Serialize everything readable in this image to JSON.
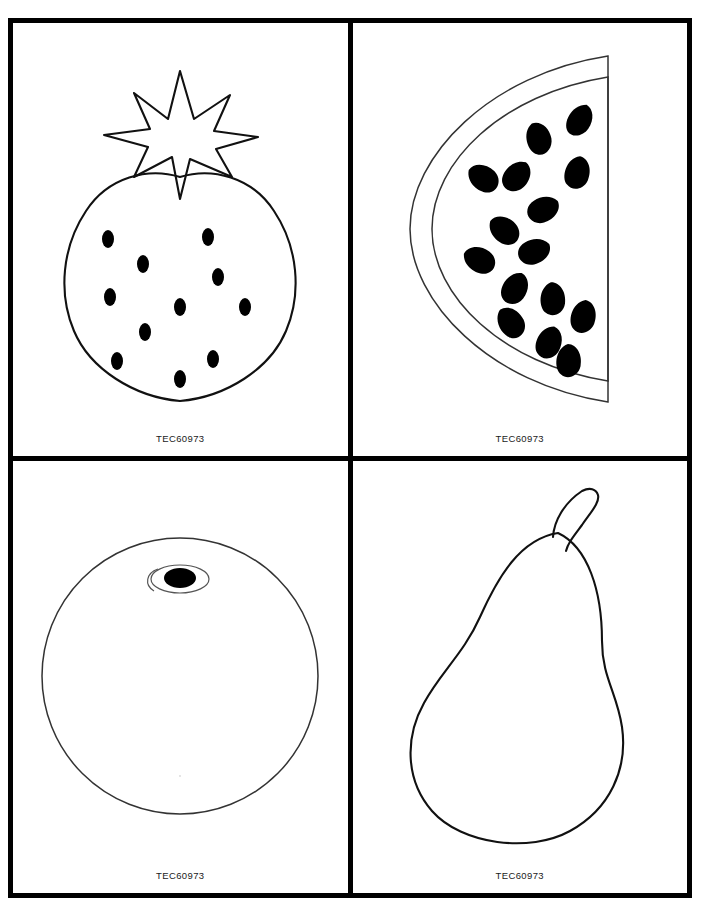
{
  "sheet": {
    "title": "Fruit Shape Templates",
    "watermark": "",
    "background_color": "#ffffff",
    "border_color": "#000000",
    "ink_color": "#111111",
    "fill_color": "#000000",
    "columns": 2,
    "rows": 2
  },
  "panels": [
    {
      "id": "panel-strawberry",
      "fruit": "strawberry",
      "label": "TEC60973",
      "icon_name": "strawberry-outline-icon",
      "seed_count": 11,
      "calyx_points": 7
    },
    {
      "id": "panel-watermelon",
      "fruit": "watermelon",
      "label": "TEC60973",
      "icon_name": "watermelon-slice-outline-icon",
      "seed_count": 15,
      "rind_bands": 2
    },
    {
      "id": "panel-orange",
      "fruit": "orange",
      "label": "TEC60973",
      "icon_name": "orange-outline-icon",
      "navel": "filled-ellipse-with-ring"
    },
    {
      "id": "panel-pear",
      "fruit": "pear",
      "label": "TEC60973",
      "icon_name": "pear-outline-icon",
      "stem": "curved-tapered-stem"
    }
  ]
}
